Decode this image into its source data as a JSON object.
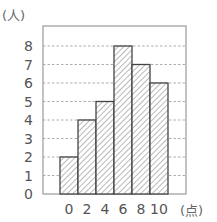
{
  "chart_data": {
    "type": "bar",
    "subtype": "histogram",
    "title": "",
    "xlabel": "(点)",
    "ylabel": "(人)",
    "categories": [
      "0",
      "2",
      "4",
      "6",
      "8",
      "10"
    ],
    "bin_edges": [
      0,
      2,
      4,
      6,
      8,
      10
    ],
    "values": [
      2,
      4,
      5,
      8,
      7,
      6
    ],
    "ylim": [
      0,
      8
    ],
    "yticks": [
      "0",
      "1",
      "2",
      "3",
      "4",
      "5",
      "6",
      "7",
      "8"
    ],
    "xticks": [
      "0",
      "2",
      "4",
      "6",
      "8",
      "10"
    ],
    "grid": "horizontal dashed",
    "bar_fill": "diagonal hatch",
    "colors": {
      "bar_stroke": "#444444",
      "hatch": "#888888",
      "grid": "#999999",
      "frame": "#999999"
    }
  },
  "labels": {
    "y_unit": "(人)",
    "x_unit": "(点)"
  }
}
